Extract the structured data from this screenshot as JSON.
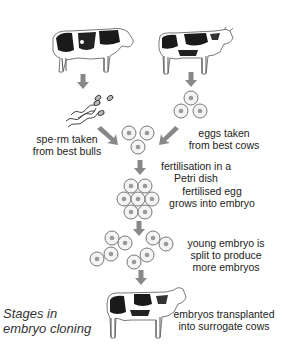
{
  "diagram": {
    "caption_line1": "Stages in",
    "caption_line2": "embryo cloning",
    "steps": [
      {
        "id": "sperm",
        "line1": "spe·rm taken",
        "line2": "from best bulls"
      },
      {
        "id": "eggs",
        "line1": "eggs taken",
        "line2": "from best cows"
      },
      {
        "id": "fertilisation",
        "line1": "fertilisation in a",
        "line2": "Petri dish"
      },
      {
        "id": "embryo",
        "line1": "fertilised egg",
        "line2": "grows into embryo"
      },
      {
        "id": "split",
        "line1": "young embryo is",
        "line2": "split to produce",
        "line3": "more embryos"
      },
      {
        "id": "transplant",
        "line1": "embryos transplanted",
        "line2": "into surrogate cows"
      }
    ],
    "colors": {
      "arrow": "#888888",
      "cell_outline": "#777777",
      "cell_nucleus": "#999999",
      "cow_dark": "#1a1a1a"
    }
  }
}
